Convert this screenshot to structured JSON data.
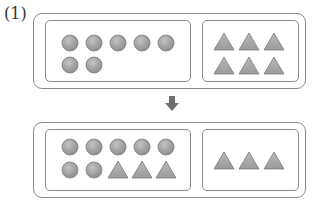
{
  "problem_label": "(1)",
  "colors": {
    "circle_fill": "#9e9e9e",
    "triangle_fill": "#a8a8a8",
    "border": "#8a8a8a",
    "arrow": "#6e6e6e"
  },
  "before": {
    "left_group": {
      "circles": 7,
      "triangles": 0
    },
    "right_group": {
      "circles": 0,
      "triangles": 6
    }
  },
  "arrow": "down-arrow",
  "after": {
    "left_group": {
      "circles": 7,
      "triangles": 3
    },
    "right_group": {
      "circles": 0,
      "triangles": 3
    }
  }
}
